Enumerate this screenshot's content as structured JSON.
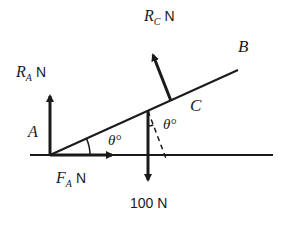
{
  "diagram": {
    "type": "free-body diagram",
    "colors": {
      "ink": "#1a1a1a",
      "background": "#ffffff"
    },
    "labels": {
      "ra_symbol": "R",
      "ra_sub": "A",
      "ra_unit": "N",
      "rc_symbol": "R",
      "rc_sub": "C",
      "rc_unit": "N",
      "fa_symbol": "F",
      "fa_sub": "A",
      "fa_unit": "N",
      "weight": "100 N",
      "point_a": "A",
      "point_b": "B",
      "point_c": "C",
      "angle_at_a": "θ°",
      "angle_at_c": "θ°"
    },
    "forces": [
      {
        "name": "R_A",
        "direction": "up",
        "unit": "N"
      },
      {
        "name": "R_C",
        "direction": "perpendicular to rod",
        "unit": "N"
      },
      {
        "name": "F_A",
        "direction": "right",
        "unit": "N"
      },
      {
        "name": "Weight",
        "direction": "down",
        "value": 100,
        "unit": "N"
      }
    ]
  }
}
